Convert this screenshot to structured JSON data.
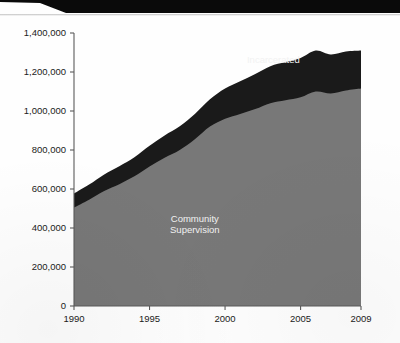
{
  "page": {
    "background_color": "#fefefe",
    "top_band_color": "#0a0a0a"
  },
  "chart_data": {
    "type": "area",
    "stacked": true,
    "title": "",
    "subtitle": "",
    "xlabel": "",
    "ylabel": "",
    "xlim": [
      1990,
      2009
    ],
    "ylim": [
      0,
      1400000
    ],
    "grid": false,
    "legend_position": "inline-annotations",
    "x": [
      1990,
      1991,
      1992,
      1993,
      1994,
      1995,
      1996,
      1997,
      1998,
      1999,
      2000,
      2001,
      2002,
      2003,
      2004,
      2005,
      2006,
      2007,
      2008,
      2009
    ],
    "categories": [
      "1990",
      "1991",
      "1992",
      "1993",
      "1994",
      "1995",
      "1996",
      "1997",
      "1998",
      "1999",
      "2000",
      "2001",
      "2002",
      "2003",
      "2004",
      "2005",
      "2006",
      "2007",
      "2008",
      "2009"
    ],
    "xticks": [
      1990,
      1995,
      2000,
      2005,
      2009
    ],
    "xtick_labels": [
      "1990",
      "1995",
      "2000",
      "2005",
      "2009"
    ],
    "yticks": [
      0,
      200000,
      400000,
      600000,
      800000,
      1000000,
      1200000,
      1400000
    ],
    "ytick_labels": [
      "0",
      "200,000",
      "400,000",
      "600,000",
      "800,000",
      "1,000,000",
      "1,200,000",
      "1,400,000"
    ],
    "series": [
      {
        "name": "Community Supervision",
        "color": "#787878",
        "label_lines": [
          "Community",
          "Supervision"
        ],
        "label_color": "#f2f2f2",
        "values": [
          505000,
          545000,
          590000,
          625000,
          665000,
          715000,
          760000,
          800000,
          855000,
          920000,
          960000,
          985000,
          1010000,
          1040000,
          1055000,
          1070000,
          1100000,
          1090000,
          1105000,
          1115000
        ]
      },
      {
        "name": "Incarcerated",
        "color": "#1a1a1a",
        "label_lines": [
          "Incarcerated"
        ],
        "label_color": "#ffffff",
        "values": [
          72000,
          78000,
          85000,
          92000,
          98000,
          107000,
          115000,
          122000,
          130000,
          140000,
          155000,
          168000,
          180000,
          190000,
          196000,
          202000,
          210000,
          200000,
          200000,
          195000
        ]
      }
    ],
    "totals": [
      577000,
      623000,
      675000,
      717000,
      763000,
      822000,
      875000,
      922000,
      985000,
      1060000,
      1115000,
      1153000,
      1190000,
      1230000,
      1251000,
      1272000,
      1310000,
      1290000,
      1305000,
      1310000
    ],
    "annotations": [
      {
        "text": "Incarcerated",
        "x": 2003.2,
        "value": 1245000,
        "color": "#ffffff"
      },
      {
        "text": "Community",
        "x": 1998.0,
        "value": 430000,
        "color": "#f2f2f2"
      },
      {
        "text": "Supervision",
        "x": 1998.0,
        "value": 375000,
        "color": "#f2f2f2"
      }
    ]
  }
}
